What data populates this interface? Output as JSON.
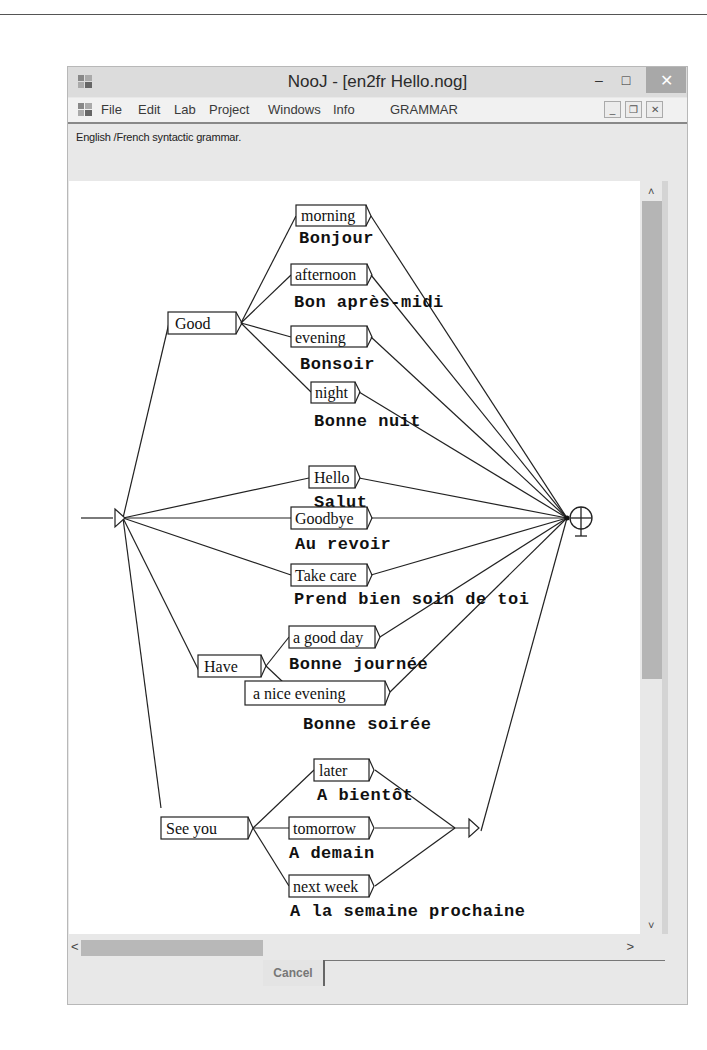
{
  "window": {
    "title": "NooJ - [en2fr Hello.nog]",
    "controls": {
      "minimize": "–",
      "maximize": "□",
      "close": "✕"
    }
  },
  "menu": {
    "items": [
      "File",
      "Edit",
      "Lab",
      "Project",
      "Windows",
      "Info",
      "GRAMMAR"
    ],
    "mdi_controls": {
      "minimize": "_",
      "restore": "❐",
      "close": "✕"
    }
  },
  "grammar": {
    "description": "English /French  syntactic grammar."
  },
  "graph": {
    "nodes": [
      {
        "id": "good",
        "label": "Good",
        "output": ""
      },
      {
        "id": "morning",
        "label": "morning",
        "output": "Bonjour"
      },
      {
        "id": "afternoon",
        "label": "afternoon",
        "output": "Bon après-midi"
      },
      {
        "id": "evening",
        "label": "evening",
        "output": "Bonsoir"
      },
      {
        "id": "night",
        "label": "night",
        "output": "Bonne nuit"
      },
      {
        "id": "hello",
        "label": "Hello",
        "output": "Salut"
      },
      {
        "id": "goodbye",
        "label": "Goodbye",
        "output": "Au revoir"
      },
      {
        "id": "takecare",
        "label": "Take care",
        "output": "Prend bien soin de toi"
      },
      {
        "id": "have",
        "label": "Have",
        "output": ""
      },
      {
        "id": "goodday",
        "label": "a good day",
        "output": "Bonne journée"
      },
      {
        "id": "niceevening",
        "label": "a nice evening",
        "output": "Bonne soirée"
      },
      {
        "id": "seeyou",
        "label": "See you",
        "output": ""
      },
      {
        "id": "later",
        "label": "later",
        "output": "A bientôt"
      },
      {
        "id": "tomorrow",
        "label": "tomorrow",
        "output": "A demain"
      },
      {
        "id": "nextweek",
        "label": "next week",
        "output": "A la semaine prochaine"
      }
    ]
  },
  "scroll": {
    "up": "˄",
    "down": "˅",
    "left": "<",
    "right": ">"
  },
  "buttons": {
    "cancel": "Cancel"
  }
}
